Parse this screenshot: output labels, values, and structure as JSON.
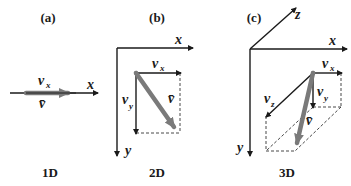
{
  "panels": [
    {
      "id": "a",
      "label": "(a)",
      "caption": "1D",
      "axes": {
        "x": "x"
      },
      "components": {
        "vx_base": "v",
        "vx_sub": "x"
      },
      "vector": "v̄"
    },
    {
      "id": "b",
      "label": "(b)",
      "caption": "2D",
      "axes": {
        "x": "x",
        "y": "y"
      },
      "components": {
        "vx_base": "v",
        "vx_sub": "x",
        "vy_base": "v",
        "vy_sub": "y"
      },
      "vector": "v̄"
    },
    {
      "id": "c",
      "label": "(c)",
      "caption": "3D",
      "axes": {
        "x": "x",
        "y": "y",
        "z": "z"
      },
      "components": {
        "vx_base": "v",
        "vx_sub": "x",
        "vy_base": "v",
        "vy_sub": "y",
        "vz_base": "v",
        "vz_sub": "z"
      },
      "vector": "v̄"
    }
  ],
  "colors": {
    "axis": "#1a1a1a",
    "vector": "#7a7a7a",
    "background": "#ffffff"
  }
}
